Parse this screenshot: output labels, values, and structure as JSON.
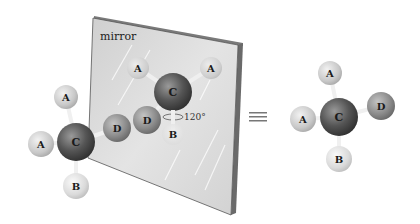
{
  "figure": {
    "mirror_label": "mirror",
    "angle_label": "120°",
    "equivalence_symbol": "≡",
    "colors": {
      "mirror_face": "#d9d9d9",
      "mirror_edge": "#6e6e6e",
      "carbon": "#555555",
      "atom_a": "#cfcfcf",
      "atom_b": "#e2e2e2",
      "atom_d": "#8e8e8e",
      "bond": "#efefef"
    },
    "left_molecule": {
      "center": "C",
      "top": "A",
      "left": "A",
      "right": "D",
      "bottom": "B"
    },
    "mirror_image": {
      "center": "C",
      "upper_left": "A",
      "upper_right": "A",
      "lower_left": "D",
      "bottom": "B"
    },
    "right_molecule": {
      "center": "C",
      "top": "A",
      "left": "A",
      "right": "D",
      "bottom": "B"
    }
  }
}
